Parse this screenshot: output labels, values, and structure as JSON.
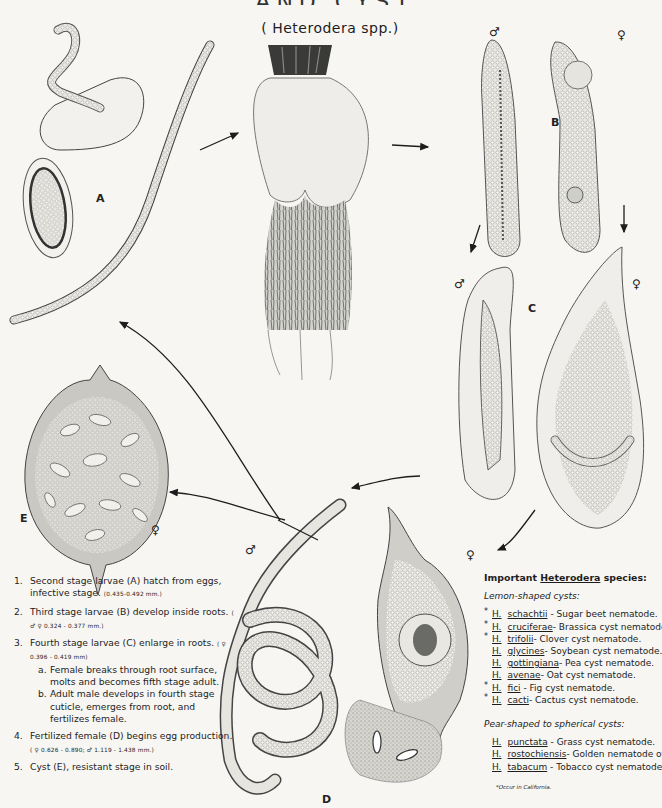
{
  "plate": {
    "title_partial": "AND CYST NEMATODES",
    "subtitle": "( Heterodera spp.)",
    "colors": {
      "paper": "#f7f6f3",
      "ink": "#1d1d1d",
      "shade": "#8a8a88"
    }
  },
  "figure_labels": {
    "A": "A",
    "B": "B",
    "C": "C",
    "D": "D",
    "E": "E",
    "male": "♂",
    "female": "♀"
  },
  "life_cycle_steps": [
    {
      "num": "1.",
      "text": "Second stage larvae (A) hatch from eggs, infective stage.",
      "measure": "(0.435-0.492 mm.)"
    },
    {
      "num": "2.",
      "text": "Third stage larvae (B) develop inside roots.",
      "measure": "( ♂ ♀ 0.324 - 0.377 mm.)"
    },
    {
      "num": "3.",
      "text": "Fourth stage larvae (C) enlarge in roots.",
      "measure": "( ♀ 0.396 - 0.419 mm)",
      "sub": [
        {
          "letter": "a.",
          "text": "Female breaks through root surface, molts and becomes fifth stage adult."
        },
        {
          "letter": "b.",
          "text": "Adult male develops in fourth stage cuticle, emerges from root, and fertilizes female."
        }
      ]
    },
    {
      "num": "4.",
      "text": "Fertilized female (D) begins egg production.",
      "measure": "( ♀ 0.626 - 0.890; ♂ 1.119 - 1.438 mm.)"
    },
    {
      "num": "5.",
      "text": "Cyst (E), resistant stage in soil.",
      "measure": ""
    }
  ],
  "species_panel": {
    "heading_prefix": "Important",
    "heading_genus": "Heterodera",
    "heading_suffix": "species:",
    "groups": [
      {
        "title": "Lemon-shaped cysts:",
        "items": [
          {
            "star": "*",
            "genus": "H.",
            "epithet": "schachtii",
            "common": "- Sugar beet nematode."
          },
          {
            "star": "*",
            "genus": "H.",
            "epithet": "cruciferae",
            "common": "- Brassica cyst nematode."
          },
          {
            "star": "*",
            "genus": "H.",
            "epithet": "trifolii",
            "common": "- Clover cyst nematode."
          },
          {
            "star": "",
            "genus": "H.",
            "epithet": "glycines",
            "common": "- Soybean cyst nematode."
          },
          {
            "star": "",
            "genus": "H.",
            "epithet": "gottingiana",
            "common": "- Pea cyst nematode."
          },
          {
            "star": "",
            "genus": "H.",
            "epithet": "avenae",
            "common": "- Oat cyst nematode."
          },
          {
            "star": "*",
            "genus": "H.",
            "epithet": "fici",
            "common": "- Fig cyst nematode."
          },
          {
            "star": "*",
            "genus": "H.",
            "epithet": "cacti",
            "common": "- Cactus cyst nematode."
          }
        ]
      },
      {
        "title": "Pear-shaped to spherical cysts:",
        "items": [
          {
            "star": "",
            "genus": "H.",
            "epithet": "punctata",
            "common": "- Grass cyst nematode."
          },
          {
            "star": "",
            "genus": "H.",
            "epithet": "rostochiensis",
            "common": "- Golden nematode of"
          },
          {
            "star": "",
            "genus": "H.",
            "epithet": "tabacum",
            "common": "- Tobacco cyst nematode."
          }
        ]
      }
    ],
    "footnote": "*Occur in California."
  }
}
